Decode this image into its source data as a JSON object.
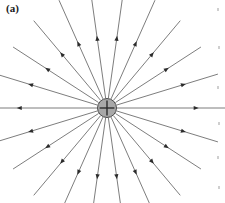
{
  "figure": {
    "panel_label": "(a)",
    "caption_visible": false,
    "width": 225,
    "height": 203,
    "background_color": "#ffffff"
  },
  "charge": {
    "sign_symbol": "+",
    "polarity": "positive",
    "center_x": 107,
    "center_y": 108,
    "radius": 9.5,
    "fill_color": "#a8a8a8",
    "outline_color": "#4a4a4a",
    "symbol_color": "#2b2b2b"
  },
  "field_lines": {
    "count": 22,
    "line_color": "#6e6e6e",
    "line_width": 0.9,
    "arrow_color": "#2b2b2b",
    "arrow_direction": "outward",
    "inner_radius": 10,
    "rays": [
      {
        "angle_deg": 0,
        "length": 120,
        "arrow_at": 0.72
      },
      {
        "angle_deg": 17,
        "length": 116,
        "arrow_at": 0.66
      },
      {
        "angle_deg": 33,
        "length": 112,
        "arrow_at": 0.6
      },
      {
        "angle_deg": 50,
        "length": 114,
        "arrow_at": 0.58
      },
      {
        "angle_deg": 66,
        "length": 118,
        "arrow_at": 0.56
      },
      {
        "angle_deg": 82,
        "length": 122,
        "arrow_at": 0.54
      },
      {
        "angle_deg": 98,
        "length": 122,
        "arrow_at": 0.54
      },
      {
        "angle_deg": 114,
        "length": 118,
        "arrow_at": 0.56
      },
      {
        "angle_deg": 130,
        "length": 114,
        "arrow_at": 0.58
      },
      {
        "angle_deg": 147,
        "length": 112,
        "arrow_at": 0.6
      },
      {
        "angle_deg": 163,
        "length": 116,
        "arrow_at": 0.66
      },
      {
        "angle_deg": 180,
        "length": 118,
        "arrow_at": 0.72
      },
      {
        "angle_deg": 197,
        "length": 116,
        "arrow_at": 0.66
      },
      {
        "angle_deg": 213,
        "length": 112,
        "arrow_at": 0.6
      },
      {
        "angle_deg": 230,
        "length": 114,
        "arrow_at": 0.58
      },
      {
        "angle_deg": 246,
        "length": 118,
        "arrow_at": 0.56
      },
      {
        "angle_deg": 262,
        "length": 120,
        "arrow_at": 0.54
      },
      {
        "angle_deg": 278,
        "length": 120,
        "arrow_at": 0.54
      },
      {
        "angle_deg": 294,
        "length": 118,
        "arrow_at": 0.56
      },
      {
        "angle_deg": 310,
        "length": 114,
        "arrow_at": 0.58
      },
      {
        "angle_deg": 327,
        "length": 112,
        "arrow_at": 0.6
      },
      {
        "angle_deg": 343,
        "length": 116,
        "arrow_at": 0.66
      }
    ]
  },
  "scan_artifacts": {
    "color": "#cfcfcf",
    "specks": [
      {
        "x": 6,
        "y": 8
      },
      {
        "x": 5,
        "y": 46
      },
      {
        "x": 6,
        "y": 86
      },
      {
        "x": 5,
        "y": 122
      },
      {
        "x": 6,
        "y": 156
      },
      {
        "x": 5,
        "y": 186
      }
    ]
  }
}
